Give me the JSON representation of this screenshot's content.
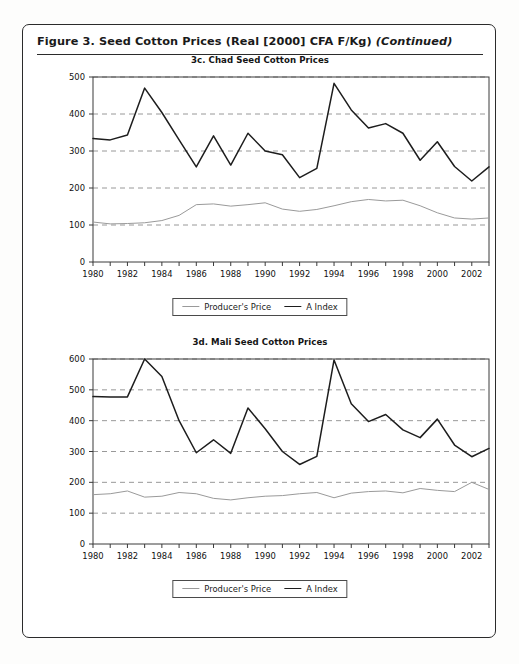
{
  "figure": {
    "caption_main": "Figure 3.  Seed Cotton Prices (Real [2000] CFA F/Kg) ",
    "caption_continued": "(Continued)"
  },
  "legend": {
    "producer_label": "Producer's Price",
    "aindex_label": "A Index"
  },
  "charts": [
    {
      "id": "chad",
      "title": "3c. Chad Seed Cotton Prices"
    },
    {
      "id": "mali",
      "title": "3d. Mali Seed Cotton Prices"
    }
  ],
  "chart_data": [
    {
      "type": "line",
      "title": "3c. Chad Seed Cotton Prices",
      "xlabel": "",
      "ylabel": "",
      "ylim": [
        0,
        500
      ],
      "yticks": [
        0,
        100,
        200,
        300,
        400,
        500
      ],
      "ytick_labels": [
        "0",
        "100",
        "200",
        "300",
        "400",
        "500"
      ],
      "xlim": [
        1980,
        2003
      ],
      "xticks": [
        1980,
        1981,
        1982,
        1983,
        1984,
        1985,
        1986,
        1987,
        1988,
        1989,
        1990,
        1991,
        1992,
        1993,
        1994,
        1995,
        1996,
        1997,
        1998,
        1999,
        2000,
        2001,
        2002,
        2003
      ],
      "xtick_labels": [
        "1980",
        "1982",
        "1984",
        "1986",
        "1988",
        "1990",
        "1992",
        "1994",
        "1996",
        "1998",
        "2000",
        "2002"
      ],
      "xtick_labelled": [
        1980,
        1982,
        1984,
        1986,
        1988,
        1990,
        1992,
        1994,
        1996,
        1998,
        2000,
        2002
      ],
      "grid": "horizontal-dashed",
      "legend_position": "below",
      "x": [
        1980,
        1981,
        1982,
        1983,
        1984,
        1985,
        1986,
        1987,
        1988,
        1989,
        1990,
        1991,
        1992,
        1993,
        1994,
        1995,
        1996,
        1997,
        1998,
        1999,
        2000,
        2001,
        2002,
        2003
      ],
      "series": [
        {
          "name": "A Index",
          "color": "#1d1d1d",
          "values": [
            334,
            330,
            343,
            470,
            404,
            330,
            257,
            341,
            262,
            348,
            300,
            290,
            228,
            253,
            483,
            411,
            362,
            374,
            348,
            275,
            325,
            258,
            219,
            257
          ]
        },
        {
          "name": "Producer's Price",
          "color": "#9a9a9a",
          "values": [
            108,
            103,
            104,
            106,
            112,
            126,
            155,
            157,
            151,
            155,
            160,
            143,
            137,
            142,
            152,
            163,
            169,
            165,
            167,
            152,
            133,
            119,
            116,
            119
          ]
        }
      ]
    },
    {
      "type": "line",
      "title": "3d. Mali Seed Cotton Prices",
      "xlabel": "",
      "ylabel": "",
      "ylim": [
        0,
        600
      ],
      "yticks": [
        0,
        100,
        200,
        300,
        400,
        500,
        600
      ],
      "ytick_labels": [
        "0",
        "100",
        "200",
        "300",
        "400",
        "500",
        "600"
      ],
      "xlim": [
        1980,
        2003
      ],
      "xticks": [
        1980,
        1981,
        1982,
        1983,
        1984,
        1985,
        1986,
        1987,
        1988,
        1989,
        1990,
        1991,
        1992,
        1993,
        1994,
        1995,
        1996,
        1997,
        1998,
        1999,
        2000,
        2001,
        2002,
        2003
      ],
      "xtick_labels": [
        "1980",
        "1982",
        "1984",
        "1986",
        "1988",
        "1990",
        "1992",
        "1994",
        "1996",
        "1998",
        "2000",
        "2002"
      ],
      "xtick_labelled": [
        1980,
        1982,
        1984,
        1986,
        1988,
        1990,
        1992,
        1994,
        1996,
        1998,
        2000,
        2002
      ],
      "grid": "horizontal-dashed",
      "legend_position": "below",
      "x": [
        1980,
        1981,
        1982,
        1983,
        1984,
        1985,
        1986,
        1987,
        1988,
        1989,
        1990,
        1991,
        1992,
        1993,
        1994,
        1995,
        1996,
        1997,
        1998,
        1999,
        2000,
        2001,
        2002,
        2003
      ],
      "series": [
        {
          "name": "A Index",
          "color": "#1d1d1d",
          "values": [
            478,
            477,
            477,
            600,
            543,
            400,
            296,
            338,
            294,
            441,
            374,
            300,
            258,
            284,
            597,
            455,
            397,
            420,
            370,
            345,
            405,
            321,
            283,
            310
          ]
        },
        {
          "name": "Producer's Price",
          "color": "#9a9a9a",
          "values": [
            160,
            163,
            172,
            152,
            155,
            167,
            163,
            148,
            143,
            150,
            155,
            157,
            163,
            167,
            150,
            165,
            170,
            172,
            166,
            180,
            174,
            170,
            200,
            177
          ]
        }
      ]
    }
  ]
}
